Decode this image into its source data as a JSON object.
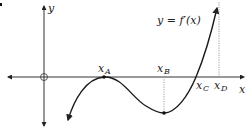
{
  "figure": {
    "curve_label": "y = f′(x)",
    "axes": {
      "x_label": "x",
      "y_label": "y",
      "origin": "O"
    },
    "points": [
      {
        "name": "x",
        "sub": "A",
        "role": "local maximum on x-axis (double root)"
      },
      {
        "name": "x",
        "sub": "B",
        "role": "local minimum"
      },
      {
        "name": "x",
        "sub": "C",
        "role": "x-intercept"
      },
      {
        "name": "x",
        "sub": "D",
        "role": "reference line"
      }
    ],
    "colors": {
      "curve": "#1a1a1a",
      "axes": "#333333",
      "dotted": "#888888",
      "background": "#ffffff"
    }
  }
}
